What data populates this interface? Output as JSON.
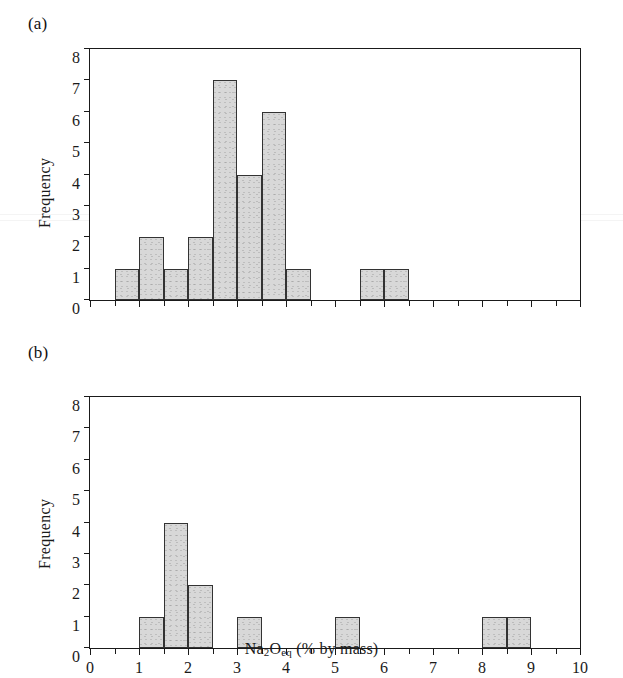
{
  "figure": {
    "panel_a_label": "(a)",
    "panel_b_label": "(b)",
    "ylabel": "Frequency",
    "xlabel_main": "Na",
    "xlabel_sub1": "2",
    "xlabel_mid": "O",
    "xlabel_sub2": "eq",
    "xlabel_tail": " (% by mass)",
    "xlabel_full": "Na2Oeq (% by mass)"
  },
  "axes": {
    "y_ticks": [
      "0",
      "1",
      "2",
      "3",
      "4",
      "5",
      "6",
      "7",
      "8"
    ],
    "x_ticks": [
      "0",
      "1",
      "2",
      "3",
      "4",
      "5",
      "6",
      "7",
      "8",
      "9",
      "10"
    ],
    "y_min": 0,
    "y_max": 8,
    "x_min": 0,
    "x_max": 10,
    "bin_width": 0.5
  },
  "colors": {
    "bar_fill": "#d8d8d8",
    "bar_stroke": "#333333",
    "axis": "#1a1a1a",
    "background": "#ffffff"
  },
  "chart_data": [
    {
      "type": "bar",
      "panel": "(a)",
      "title": "",
      "xlabel": "Na2Oeq (% by mass)",
      "ylabel": "Frequency",
      "xlim": [
        0,
        10
      ],
      "ylim": [
        0,
        8
      ],
      "bin_width": 0.5,
      "grid": false,
      "legend": "none",
      "bins": [
        {
          "x0": 0.5,
          "x1": 1.0,
          "value": 1
        },
        {
          "x0": 1.0,
          "x1": 1.5,
          "value": 2
        },
        {
          "x0": 1.5,
          "x1": 2.0,
          "value": 1
        },
        {
          "x0": 2.0,
          "x1": 2.5,
          "value": 2
        },
        {
          "x0": 2.5,
          "x1": 3.0,
          "value": 7
        },
        {
          "x0": 3.0,
          "x1": 3.5,
          "value": 4
        },
        {
          "x0": 3.5,
          "x1": 4.0,
          "value": 6
        },
        {
          "x0": 4.0,
          "x1": 4.5,
          "value": 1
        },
        {
          "x0": 5.5,
          "x1": 6.0,
          "value": 1
        },
        {
          "x0": 6.0,
          "x1": 6.5,
          "value": 1
        }
      ]
    },
    {
      "type": "bar",
      "panel": "(b)",
      "title": "",
      "xlabel": "Na2Oeq (% by mass)",
      "ylabel": "Frequency",
      "xlim": [
        0,
        10
      ],
      "ylim": [
        0,
        8
      ],
      "bin_width": 0.5,
      "grid": false,
      "legend": "none",
      "bins": [
        {
          "x0": 1.0,
          "x1": 1.5,
          "value": 1
        },
        {
          "x0": 1.5,
          "x1": 2.0,
          "value": 4
        },
        {
          "x0": 2.0,
          "x1": 2.5,
          "value": 2
        },
        {
          "x0": 3.0,
          "x1": 3.5,
          "value": 1
        },
        {
          "x0": 5.0,
          "x1": 5.5,
          "value": 1
        },
        {
          "x0": 8.0,
          "x1": 8.5,
          "value": 1
        },
        {
          "x0": 8.5,
          "x1": 9.0,
          "value": 1
        }
      ]
    }
  ]
}
